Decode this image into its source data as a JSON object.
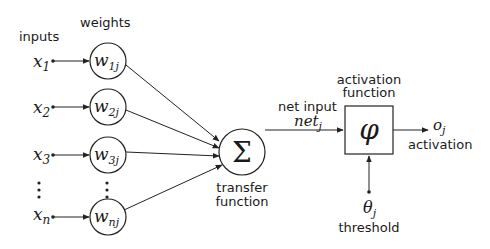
{
  "labels": {
    "inputs": "inputs",
    "weights": "weights",
    "net_input": "net input",
    "activation_function_l1": "activation",
    "activation_function_l2": "function",
    "transfer_l1": "transfer",
    "transfer_l2": "function",
    "activation": "activation",
    "threshold": "threshold"
  },
  "inputs": [
    {
      "var": "x",
      "sub": "1",
      "weight": "w",
      "wsub": "1j"
    },
    {
      "var": "x",
      "sub": "2",
      "weight": "w",
      "wsub": "2j"
    },
    {
      "var": "x",
      "sub": "3",
      "weight": "w",
      "wsub": "3j"
    },
    {
      "var": "x",
      "sub": "n",
      "weight": "w",
      "wsub": "nj"
    }
  ],
  "symbols": {
    "sum": "Σ",
    "phi": "φ",
    "net": "net",
    "net_sub": "j",
    "output": "o",
    "output_sub": "j",
    "theta": "θ",
    "theta_sub": "j",
    "ellipsis": "⋮"
  }
}
